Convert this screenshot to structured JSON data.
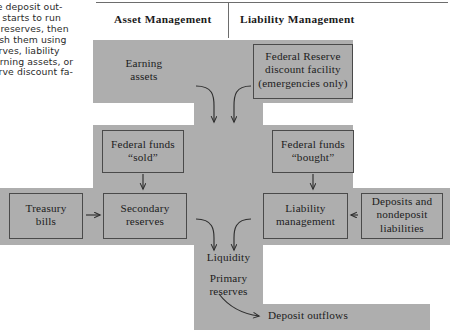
{
  "body_text": {
    "lines": [
      "ndle deposit out-",
      "ank starts to run",
      "ary reserves, then",
      "lenish them using",
      "eserves, liability",
      ", earning assets, or",
      "eserve discount fa-"
    ]
  },
  "header": {
    "asset": "Asset Management",
    "liability": "Liability Management"
  },
  "diagram": {
    "nodes": {
      "earning_assets": "Earning\nassets",
      "fed_discount": "Federal Reserve\ndiscount facility\n(emergencies only)",
      "ff_sold": "Federal funds\n“sold”",
      "ff_bought": "Federal funds\n“bought”",
      "treasury_bills": "Treasury\nbills",
      "secondary_reserves": "Secondary\nreserves",
      "liability_management": "Liability\nmanagement",
      "deposits_nondeposit": "Deposits and\nnondeposit\nliabilities",
      "liquidity": "Liquidity",
      "primary_reserves": "Primary\nreserves",
      "deposit_outflows": "Deposit outflows"
    }
  },
  "colors": {
    "grey_fill": "#aeaeae",
    "box_stroke": "#4a4a4a",
    "text": "#1c1c1c",
    "page_bg": "#ffffff"
  }
}
